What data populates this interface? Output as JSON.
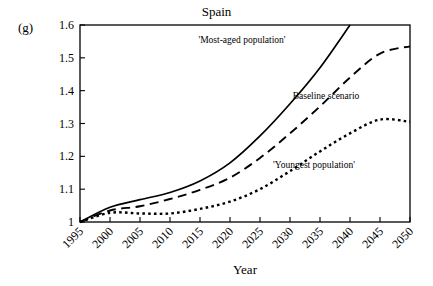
{
  "panel": {
    "label": "(g)"
  },
  "chart_data": {
    "type": "line",
    "title": "Spain",
    "xlabel": "Year",
    "ylabel": "Public expenditure index/\nworking age pop. index (1995=1)",
    "xlim": [
      1995,
      2050
    ],
    "ylim": [
      1.0,
      1.6
    ],
    "grid": false,
    "legend_position": "inline-annotations",
    "xticks": [
      1995,
      2000,
      2005,
      2010,
      2015,
      2020,
      2025,
      2030,
      2035,
      2040,
      2045,
      2050
    ],
    "xtick_labels": [
      "1995",
      "2000",
      "2005",
      "2010",
      "2015",
      "2020",
      "2025",
      "2030",
      "2035",
      "2040",
      "2045",
      "2050"
    ],
    "yticks": [
      1.0,
      1.1,
      1.2,
      1.3,
      1.4,
      1.5,
      1.6
    ],
    "ytick_labels": [
      "1",
      "1.1",
      "1.2",
      "1.3",
      "1.4",
      "1.5",
      "1.6"
    ],
    "x": [
      1995,
      2000,
      2005,
      2010,
      2015,
      2020,
      2025,
      2030,
      2035,
      2040,
      2045,
      2050
    ],
    "series": [
      {
        "name": "'Most-aged population'",
        "style": "solid",
        "annotation": "'Most-aged population'",
        "clipped_at_top": true,
        "values": [
          1.0,
          1.045,
          1.068,
          1.09,
          1.125,
          1.18,
          1.262,
          1.36,
          1.47,
          1.6,
          null,
          null
        ]
      },
      {
        "name": "Baseline scenario",
        "style": "dashed",
        "annotation": "Baseline scenario",
        "values": [
          1.0,
          1.035,
          1.048,
          1.07,
          1.098,
          1.135,
          1.195,
          1.27,
          1.352,
          1.44,
          1.513,
          1.535
        ]
      },
      {
        "name": "'Youngest population'",
        "style": "dotted",
        "annotation": "'Youngest population'",
        "values": [
          1.0,
          1.028,
          1.026,
          1.026,
          1.04,
          1.062,
          1.1,
          1.155,
          1.215,
          1.27,
          1.312,
          1.305
        ]
      }
    ],
    "annotations": [
      {
        "text": "'Most-aged population'",
        "x": 2022,
        "y": 1.545
      },
      {
        "text": "Baseline scenario",
        "x": 2036,
        "y": 1.375
      },
      {
        "text": "'Youngest population'",
        "x": 2034,
        "y": 1.165
      }
    ],
    "colors": {
      "line": "#000000",
      "background": "#ffffff"
    }
  }
}
